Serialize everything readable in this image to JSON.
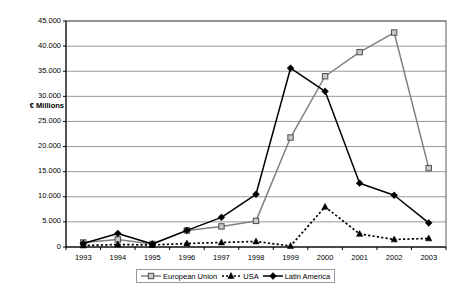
{
  "chart_data": {
    "type": "line",
    "title": "",
    "xlabel": "",
    "ylabel": "€ Millions",
    "categories": [
      "1993",
      "1994",
      "1995",
      "1996",
      "1997",
      "1998",
      "1999",
      "2000",
      "2001",
      "2002",
      "2003"
    ],
    "x": [
      1993,
      1994,
      1995,
      1996,
      1997,
      1998,
      1999,
      2000,
      2001,
      2002,
      2003
    ],
    "ylim": [
      0,
      45000
    ],
    "ytick_values": [
      0,
      5000,
      10000,
      15000,
      20000,
      25000,
      30000,
      35000,
      40000,
      45000
    ],
    "ytick_labels": [
      "0",
      "5.000",
      "10.000",
      "15.000",
      "20.000",
      "25.000",
      "30.000",
      "35.000",
      "40.000",
      "45.000"
    ],
    "grid": "horizontal",
    "legend_position": "bottom-center",
    "series": [
      {
        "name": "European Union",
        "color": "#808080",
        "marker": "square-open",
        "line_style": "solid",
        "values": [
          900,
          1500,
          600,
          3300,
          4100,
          5200,
          21800,
          34000,
          38800,
          42700,
          15700
        ]
      },
      {
        "name": "USA",
        "color": "#000000",
        "marker": "triangle-filled",
        "line_style": "dotted",
        "values": [
          300,
          500,
          400,
          700,
          900,
          1100,
          200,
          8000,
          2600,
          1500,
          1700
        ]
      },
      {
        "name": "Latin America",
        "color": "#000000",
        "marker": "diamond-filled",
        "line_style": "solid",
        "values": [
          700,
          2700,
          600,
          3300,
          5900,
          10500,
          35600,
          31000,
          12700,
          10300,
          4800
        ]
      }
    ]
  },
  "legend": {
    "items": [
      {
        "label": "European Union",
        "marker": "square-open",
        "color": "#808080"
      },
      {
        "label": "USA",
        "marker": "triangle-filled",
        "color": "#000000"
      },
      {
        "label": "Latin America",
        "marker": "diamond-filled",
        "color": "#000000"
      }
    ]
  },
  "axes": {
    "y_title": "€ Millions"
  }
}
